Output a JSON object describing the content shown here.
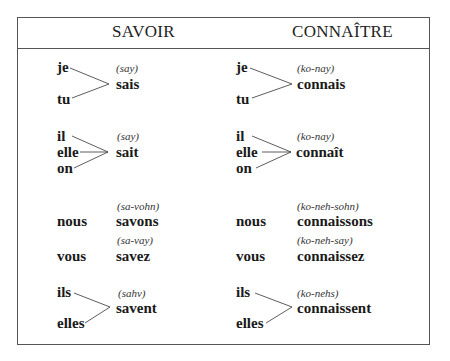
{
  "headers": {
    "savoir": "SAVOIR",
    "connaitre": "CONNAÎTRE"
  },
  "savoir": {
    "group1": {
      "pronouns": [
        "je",
        "tu"
      ],
      "phonetic": "(say)",
      "form": "sais"
    },
    "group2": {
      "pronouns": [
        "il",
        "elle",
        "on"
      ],
      "phonetic": "(say)",
      "form": "sait"
    },
    "nous": {
      "pronoun": "nous",
      "phonetic": "(sa-vohn)",
      "form": "savons"
    },
    "vous": {
      "pronoun": "vous",
      "phonetic": "(sa-vay)",
      "form": "savez"
    },
    "group3": {
      "pronouns": [
        "ils",
        "elles"
      ],
      "phonetic": "(sahv)",
      "form": "savent"
    }
  },
  "connaitre": {
    "group1": {
      "pronouns": [
        "je",
        "tu"
      ],
      "phonetic": "(ko-nay)",
      "form": "connais"
    },
    "group2": {
      "pronouns": [
        "il",
        "elle",
        "on"
      ],
      "phonetic": "(ko-nay)",
      "form": "connaît"
    },
    "nous": {
      "pronoun": "nous",
      "phonetic": "(ko-neh-sohn)",
      "form": "connaissons"
    },
    "vous": {
      "pronoun": "vous",
      "phonetic": "(ko-neh-say)",
      "form": "connaissez"
    },
    "group3": {
      "pronouns": [
        "ils",
        "elles"
      ],
      "phonetic": "(ko-nehs)",
      "form": "connaissent"
    }
  }
}
